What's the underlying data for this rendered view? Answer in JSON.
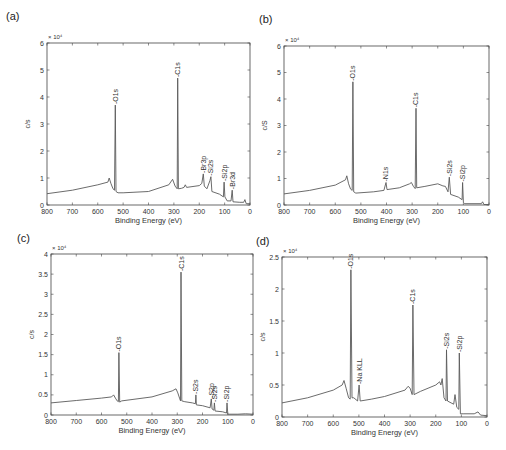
{
  "chart_data": [
    {
      "type": "line",
      "panel_label": "(a)",
      "title": "",
      "xlabel": "Binding Energy (eV)",
      "ylabel": "c/s",
      "y_multiplier": "× 10⁴",
      "xlim": [
        800,
        0
      ],
      "ylim": [
        0,
        6
      ],
      "xticks": [
        800,
        700,
        600,
        500,
        400,
        300,
        200,
        100,
        0
      ],
      "yticks": [
        0,
        1,
        2,
        3,
        4,
        5,
        6
      ],
      "grid": false,
      "box": {
        "left": 47,
        "top": 43,
        "right": 250,
        "bottom": 205
      },
      "spectrum": [
        [
          800,
          0.42
        ],
        [
          700,
          0.55
        ],
        [
          600,
          0.75
        ],
        [
          560,
          0.85
        ],
        [
          555,
          1.0
        ],
        [
          548,
          0.8
        ],
        [
          540,
          0.6
        ],
        [
          534,
          0.55
        ],
        [
          531,
          3.7
        ],
        [
          528,
          0.5
        ],
        [
          520,
          0.45
        ],
        [
          500,
          0.45
        ],
        [
          400,
          0.5
        ],
        [
          320,
          0.75
        ],
        [
          305,
          0.95
        ],
        [
          295,
          0.7
        ],
        [
          287,
          0.6
        ],
        [
          285,
          4.7
        ],
        [
          282,
          0.6
        ],
        [
          270,
          0.62
        ],
        [
          260,
          0.65
        ],
        [
          255,
          0.75
        ],
        [
          250,
          0.65
        ],
        [
          200,
          0.72
        ],
        [
          190,
          0.8
        ],
        [
          184,
          1.15
        ],
        [
          180,
          0.7
        ],
        [
          170,
          0.6
        ],
        [
          158,
          0.9
        ],
        [
          154,
          1.05
        ],
        [
          150,
          0.5
        ],
        [
          120,
          0.4
        ],
        [
          105,
          0.3
        ],
        [
          102,
          0.85
        ],
        [
          99,
          0.3
        ],
        [
          90,
          0.15
        ],
        [
          75,
          0.15
        ],
        [
          70,
          0.55
        ],
        [
          67,
          0.12
        ],
        [
          40,
          0.1
        ],
        [
          25,
          0.1
        ],
        [
          20,
          0.2
        ],
        [
          15,
          0.05
        ],
        [
          0,
          0.05
        ]
      ],
      "peaks": [
        {
          "label": "O1s",
          "x": 531,
          "y": 3.7
        },
        {
          "label": "C1s",
          "x": 285,
          "y": 4.7
        },
        {
          "label": "Br3p",
          "x": 184,
          "y": 1.15
        },
        {
          "label": "Si2s",
          "x": 154,
          "y": 1.05
        },
        {
          "label": "Si2p",
          "x": 102,
          "y": 0.85
        },
        {
          "label": "Br3d",
          "x": 70,
          "y": 0.55
        }
      ]
    },
    {
      "type": "line",
      "panel_label": "(b)",
      "title": "",
      "xlabel": "Binding Energy (eV)",
      "ylabel": "c/S",
      "y_multiplier": "× 10⁴",
      "xlim": [
        800,
        0
      ],
      "ylim": [
        0,
        6
      ],
      "xticks": [
        800,
        700,
        600,
        500,
        400,
        300,
        200,
        100,
        0
      ],
      "yticks": [
        0,
        1,
        2,
        3,
        4,
        5,
        6
      ],
      "grid": false,
      "box": {
        "left": 284,
        "top": 46,
        "right": 489,
        "bottom": 205
      },
      "spectrum": [
        [
          800,
          0.42
        ],
        [
          700,
          0.55
        ],
        [
          600,
          0.75
        ],
        [
          560,
          0.95
        ],
        [
          555,
          1.1
        ],
        [
          548,
          0.8
        ],
        [
          540,
          0.6
        ],
        [
          534,
          0.55
        ],
        [
          531,
          4.65
        ],
        [
          528,
          0.5
        ],
        [
          520,
          0.45
        ],
        [
          450,
          0.5
        ],
        [
          410,
          0.55
        ],
        [
          402,
          0.85
        ],
        [
          398,
          0.58
        ],
        [
          350,
          0.65
        ],
        [
          310,
          0.8
        ],
        [
          303,
          0.85
        ],
        [
          295,
          0.7
        ],
        [
          288,
          0.62
        ],
        [
          285,
          3.65
        ],
        [
          282,
          0.65
        ],
        [
          250,
          0.7
        ],
        [
          200,
          0.8
        ],
        [
          180,
          0.72
        ],
        [
          170,
          0.7
        ],
        [
          160,
          0.5
        ],
        [
          155,
          1.05
        ],
        [
          150,
          0.4
        ],
        [
          120,
          0.3
        ],
        [
          105,
          0.2
        ],
        [
          103,
          0.85
        ],
        [
          100,
          0.1
        ],
        [
          95,
          0.05
        ],
        [
          30,
          0.05
        ],
        [
          25,
          0.12
        ],
        [
          20,
          0.02
        ],
        [
          0,
          0.02
        ]
      ],
      "peaks": [
        {
          "label": "O1s",
          "x": 531,
          "y": 4.65
        },
        {
          "label": "N1s",
          "x": 402,
          "y": 0.85
        },
        {
          "label": "C1s",
          "x": 285,
          "y": 3.65
        },
        {
          "label": "Si2s",
          "x": 155,
          "y": 1.05
        },
        {
          "label": "Si2p",
          "x": 103,
          "y": 0.85
        }
      ]
    },
    {
      "type": "line",
      "panel_label": "(c)",
      "title": "",
      "xlabel": "Binding Energy (eV)",
      "ylabel": "c/s",
      "y_multiplier": "× 10⁴",
      "xlim": [
        800,
        0
      ],
      "ylim": [
        0,
        4
      ],
      "xticks": [
        800,
        700,
        600,
        500,
        400,
        300,
        200,
        100,
        0
      ],
      "yticks": [
        0,
        0.5,
        1,
        1.5,
        2,
        2.5,
        3,
        3.5,
        4
      ],
      "grid": false,
      "box": {
        "left": 51,
        "top": 254,
        "right": 253,
        "bottom": 415
      },
      "spectrum": [
        [
          800,
          0.3
        ],
        [
          700,
          0.36
        ],
        [
          600,
          0.42
        ],
        [
          560,
          0.45
        ],
        [
          552,
          0.5
        ],
        [
          545,
          0.42
        ],
        [
          538,
          0.35
        ],
        [
          533,
          0.33
        ],
        [
          531,
          1.55
        ],
        [
          528,
          0.32
        ],
        [
          520,
          0.35
        ],
        [
          400,
          0.45
        ],
        [
          320,
          0.6
        ],
        [
          305,
          0.65
        ],
        [
          298,
          0.55
        ],
        [
          290,
          0.4
        ],
        [
          287,
          0.35
        ],
        [
          285,
          3.55
        ],
        [
          282,
          0.35
        ],
        [
          270,
          0.33
        ],
        [
          240,
          0.3
        ],
        [
          228,
          0.28
        ],
        [
          226,
          0.5
        ],
        [
          224,
          0.25
        ],
        [
          200,
          0.23
        ],
        [
          170,
          0.18
        ],
        [
          165,
          0.4
        ],
        [
          162,
          0.15
        ],
        [
          155,
          0.12
        ],
        [
          153,
          0.3
        ],
        [
          150,
          0.1
        ],
        [
          120,
          0.08
        ],
        [
          105,
          0.05
        ],
        [
          103,
          0.3
        ],
        [
          100,
          0.02
        ],
        [
          60,
          0.02
        ],
        [
          30,
          0.03
        ],
        [
          0,
          0.02
        ]
      ],
      "peaks": [
        {
          "label": "O1s",
          "x": 531,
          "y": 1.55
        },
        {
          "label": "C1s",
          "x": 285,
          "y": 3.55
        },
        {
          "label": "S2s",
          "x": 226,
          "y": 0.5
        },
        {
          "label": "S2p",
          "x": 165,
          "y": 0.4
        },
        {
          "label": "Si2s",
          "x": 153,
          "y": 0.3
        },
        {
          "label": "Si2p",
          "x": 103,
          "y": 0.3
        }
      ]
    },
    {
      "type": "line",
      "panel_label": "(d)",
      "title": "",
      "xlabel": "Binding Energy (eV)",
      "ylabel": "c/s",
      "y_multiplier": "× 10⁴",
      "xlim": [
        800,
        0
      ],
      "ylim": [
        0,
        2.5
      ],
      "xticks": [
        800,
        700,
        600,
        500,
        400,
        300,
        200,
        100,
        0
      ],
      "yticks": [
        0,
        0.5,
        1,
        1.5,
        2,
        2.5
      ],
      "grid": false,
      "box": {
        "left": 282,
        "top": 257,
        "right": 487,
        "bottom": 417
      },
      "spectrum": [
        [
          800,
          0.22
        ],
        [
          700,
          0.3
        ],
        [
          600,
          0.42
        ],
        [
          565,
          0.5
        ],
        [
          558,
          0.57
        ],
        [
          550,
          0.45
        ],
        [
          540,
          0.3
        ],
        [
          534,
          0.28
        ],
        [
          531,
          2.3
        ],
        [
          527,
          0.3
        ],
        [
          520,
          0.3
        ],
        [
          505,
          0.25
        ],
        [
          499,
          0.5
        ],
        [
          495,
          0.25
        ],
        [
          450,
          0.28
        ],
        [
          400,
          0.32
        ],
        [
          320,
          0.42
        ],
        [
          308,
          0.48
        ],
        [
          300,
          0.45
        ],
        [
          292,
          0.35
        ],
        [
          289,
          1.75
        ],
        [
          285,
          0.35
        ],
        [
          260,
          0.4
        ],
        [
          200,
          0.5
        ],
        [
          185,
          0.55
        ],
        [
          180,
          0.5
        ],
        [
          175,
          0.6
        ],
        [
          168,
          0.3
        ],
        [
          160,
          0.25
        ],
        [
          158,
          1.05
        ],
        [
          154,
          0.25
        ],
        [
          140,
          0.22
        ],
        [
          130,
          0.2
        ],
        [
          125,
          0.35
        ],
        [
          118,
          0.15
        ],
        [
          110,
          0.12
        ],
        [
          108,
          1.0
        ],
        [
          104,
          0.05
        ],
        [
          90,
          0.05
        ],
        [
          50,
          0.05
        ],
        [
          35,
          0.08
        ],
        [
          25,
          0.03
        ],
        [
          0,
          0.02
        ]
      ],
      "peaks": [
        {
          "label": "O1s",
          "x": 531,
          "y": 2.3
        },
        {
          "label": "Na KLL",
          "x": 499,
          "y": 0.5
        },
        {
          "label": "C1s",
          "x": 289,
          "y": 1.75
        },
        {
          "label": "Si2s",
          "x": 158,
          "y": 1.05
        },
        {
          "label": "Si2p",
          "x": 108,
          "y": 1.0
        }
      ]
    }
  ],
  "colors": {
    "line": "#5a5a5a",
    "axis": "#444444",
    "text": "#333333"
  }
}
